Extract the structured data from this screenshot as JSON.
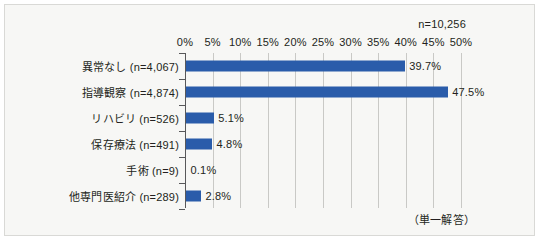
{
  "chart_data": {
    "type": "bar",
    "orientation": "horizontal",
    "title": "",
    "subtitle": "",
    "xlabel": "",
    "ylabel": "",
    "xlim": [
      0,
      50
    ],
    "xtick_step": 5,
    "xtick_labels": [
      "0%",
      "5%",
      "10%",
      "15%",
      "20%",
      "25%",
      "30%",
      "35%",
      "40%",
      "45%",
      "50%"
    ],
    "xtick_values": [
      0,
      5,
      10,
      15,
      20,
      25,
      30,
      35,
      40,
      45,
      50
    ],
    "grid": true,
    "legend": "none",
    "bar_color": "#2a5caa",
    "categories": [
      "異常なし (n=4,067)",
      "指導観察 (n=4,874)",
      "リハビリ (n=526)",
      "保存療法 (n=491)",
      "手術 (n=9)",
      "他専門医紹介 (n=289)"
    ],
    "values": [
      39.7,
      47.5,
      5.1,
      4.8,
      0.1,
      2.8
    ],
    "value_labels": [
      "39.7%",
      "47.5%",
      "5.1%",
      "4.8%",
      "0.1%",
      "2.8%"
    ],
    "counts": [
      4067,
      4874,
      526,
      491,
      9,
      289
    ],
    "annotations": {
      "total": "n=10,256",
      "answer_type": "（単一解答）"
    }
  }
}
